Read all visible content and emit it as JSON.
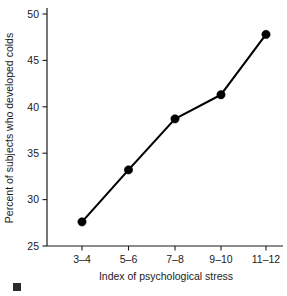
{
  "chart_data": {
    "type": "line",
    "title": "",
    "subtitle": "",
    "xlabel": "Index of psychological stress",
    "ylabel": "Percent of subjects who developed colds",
    "categories": [
      "3–4",
      "5–6",
      "7–8",
      "9–10",
      "11–12"
    ],
    "values": [
      27.6,
      33.2,
      38.7,
      41.3,
      47.8
    ],
    "series": [
      {
        "name": "Percent of subjects who developed colds",
        "values": [
          27.6,
          33.2,
          38.7,
          41.3,
          47.8
        ]
      }
    ],
    "ylim": [
      25,
      50
    ],
    "yticks": [
      25,
      30,
      35,
      40,
      45,
      50
    ],
    "ytick_labels": [
      "25",
      "30",
      "35",
      "40",
      "45",
      "50"
    ],
    "xtick_labels": [
      "3–4",
      "5–6",
      "7–8",
      "9–10",
      "11–12"
    ],
    "grid": false,
    "legend": false,
    "legend_position": "none",
    "marker": "circle",
    "line_color": "#000000",
    "marker_color": "#000000",
    "axis_color": "#1a1a1a",
    "background_color": "#ffffff"
  },
  "axis": {
    "y_title": "Percent of subjects who developed colds",
    "x_title": "Index of psychological stress",
    "y_tick_0": "25",
    "y_tick_1": "30",
    "y_tick_2": "35",
    "y_tick_3": "40",
    "y_tick_4": "45",
    "y_tick_5": "50",
    "x_tick_0": "3–4",
    "x_tick_1": "5–6",
    "x_tick_2": "7–8",
    "x_tick_3": "9–10",
    "x_tick_4": "11–12"
  }
}
